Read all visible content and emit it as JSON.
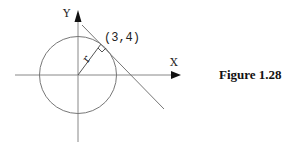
{
  "figure": {
    "caption": "Figure 1.28",
    "x_axis_label": "X",
    "y_axis_label": "Y",
    "point_label": "(3,4)",
    "radius_label": "r",
    "elements": [
      "circle centered at origin",
      "radius r to point (3,4)",
      "tangent line at (3,4)",
      "right-angle marker"
    ],
    "colors": {
      "stroke": "#555555",
      "text": "#222222"
    }
  }
}
